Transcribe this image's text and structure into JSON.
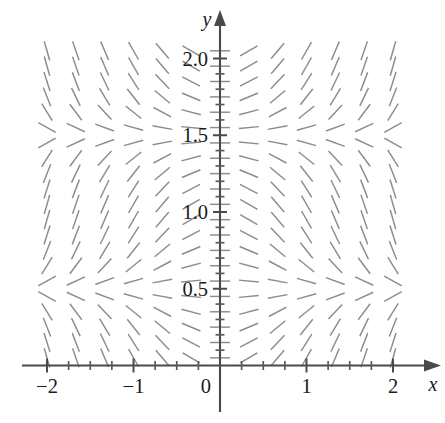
{
  "figure": {
    "type": "slope-field",
    "title": "",
    "axis_x_label": "x",
    "axis_y_label": "y",
    "origin_label": "0"
  },
  "axes": {
    "x_ticks_labeled": [
      {
        "value": -2,
        "label": "−2"
      },
      {
        "value": -1,
        "label": "−1"
      },
      {
        "value": 0,
        "label": "0"
      },
      {
        "value": 1,
        "label": "1"
      },
      {
        "value": 2,
        "label": "2"
      }
    ],
    "y_ticks_labeled": [
      {
        "value": 0.5,
        "label": "0.5"
      },
      {
        "value": 1.0,
        "label": "1.0"
      },
      {
        "value": 1.5,
        "label": "1.5"
      },
      {
        "value": 2.0,
        "label": "2.0"
      }
    ],
    "x_minor_tick_step": 0.25,
    "y_minor_tick_step": 0.1,
    "xlim": [
      -2.35,
      2.35
    ],
    "ylim": [
      -0.2,
      2.15
    ],
    "x_label": "x",
    "y_label": "y"
  },
  "chart_data": {
    "type": "scatter",
    "subtype": "slope-field",
    "title": "",
    "xlabel": "x",
    "ylabel": "y",
    "xlim": [
      -2.35,
      2.35
    ],
    "ylim": [
      -0.2,
      2.15
    ],
    "grid": false,
    "legend": null,
    "slope_formula": "dy/dx = x * cos(pi * y)",
    "nullclines_y": [
      0.5,
      1.5
    ],
    "sample_x": [
      -2.0,
      -1.6667,
      -1.3333,
      -1.0,
      -0.6667,
      -0.3333,
      0.0,
      0.3333,
      0.6667,
      1.0,
      1.3333,
      1.6667,
      2.0
    ],
    "sample_y": [
      0.05,
      0.15,
      0.25,
      0.35,
      0.45,
      0.55,
      0.65,
      0.75,
      0.85,
      0.95,
      1.05,
      1.15,
      1.25,
      1.35,
      1.45,
      1.55,
      1.65,
      1.75,
      1.85,
      1.95,
      2.05
    ],
    "segment_length_px": 20,
    "colors": {
      "segment": "#8c8c8c",
      "axis": "#4a4a4a",
      "label": "#1a1a1a",
      "background": "#ffffff"
    }
  }
}
